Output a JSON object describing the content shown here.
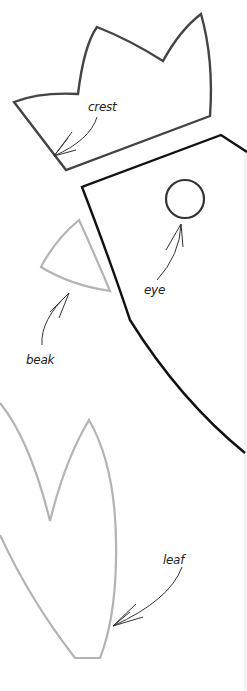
{
  "page": {
    "top_partial_text": "...",
    "colors": {
      "crest_stroke": "#444444",
      "head_stroke": "#111111",
      "beak_stroke": "#b3b3b3",
      "leaf_stroke": "#b3b3b3",
      "label_color": "#222222",
      "background": "#ffffff"
    }
  },
  "shapes": {
    "crest": {
      "label": "crest"
    },
    "head": {
      "label": ""
    },
    "eye": {
      "label": "eye"
    },
    "beak": {
      "label": "beak"
    },
    "leaf": {
      "label": "leaf"
    }
  },
  "labels": {
    "crest": "crest",
    "eye": "eye",
    "beak": "beak",
    "leaf": "leaf"
  }
}
